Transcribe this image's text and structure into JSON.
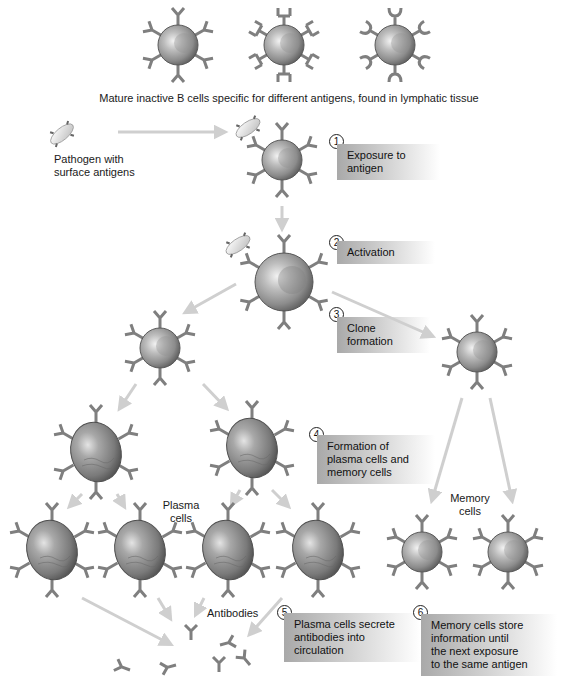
{
  "title": "Mature inactive B cells specific for different antigens, found in lymphatic tissue",
  "labels": {
    "pathogen": "Pathogen with\nsurface antigens",
    "plasma_cells": "Plasma\ncells",
    "memory_cells": "Memory\ncells",
    "antibodies": "Antibodies"
  },
  "steps": [
    {
      "num": "1",
      "text": "Exposure to\nantigen"
    },
    {
      "num": "2",
      "text": "Activation"
    },
    {
      "num": "3",
      "text": "Clone\nformation"
    },
    {
      "num": "4",
      "text": "Formation of\nplasma cells and\nmemory cells"
    },
    {
      "num": "5",
      "text": "Plasma cells secrete\nantibodies into\ncirculation"
    },
    {
      "num": "6",
      "text": "Memory cells store\ninformation until\nthe next exposure\nto the same antigen"
    }
  ],
  "colors": {
    "cell_body": "#8a8a8a",
    "receptor": "#7d7d7d",
    "arrow": "#cfcfcf",
    "label_box_start": "#a9a9a9"
  }
}
